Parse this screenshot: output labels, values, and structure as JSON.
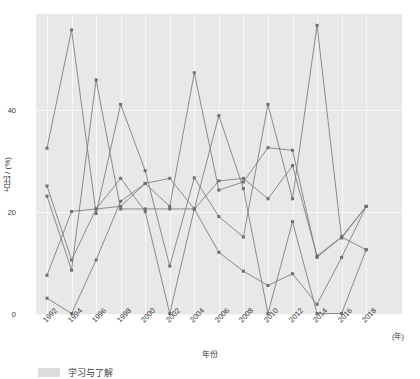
{
  "chart_data": {
    "type": "line",
    "title": "",
    "xlabel": "年份",
    "ylabel": "占比 / (%)",
    "x_unit": "(年)",
    "x": [
      1992,
      1994,
      1996,
      1998,
      2000,
      2002,
      2004,
      2006,
      2008,
      2010,
      2012,
      2014,
      2016,
      2018
    ],
    "categories": [
      "1992",
      "1994",
      "1996",
      "1998",
      "2000",
      "2002",
      "2004",
      "2006",
      "2008",
      "2010",
      "2012",
      "2014",
      "2016",
      "2018"
    ],
    "xtick_labels": [
      "1992",
      "1994",
      "1996",
      "1998",
      "2000",
      "2002",
      "2004",
      "2006",
      "2008",
      "2010",
      "2012",
      "2014",
      "2016",
      "2018"
    ],
    "ytick_labels": [
      "0",
      "20",
      "40"
    ],
    "yticks": [
      0,
      20,
      40
    ],
    "ylim": [
      -1.5,
      58.5
    ],
    "xlim": [
      1991,
      2019.5
    ],
    "grid": true,
    "grid_color": "#f7f7f7",
    "panel_background": "#e8e8e8",
    "legend_position": "bottom-left",
    "line_color": "#7f7f7f",
    "marker_color": "#6e6e6e",
    "series": [
      {
        "name": "s1",
        "values": [
          32.4,
          55.6,
          19.6,
          41.0,
          28.0,
          9.3,
          26.6,
          19.0,
          15.0,
          41.0,
          22.5,
          56.5,
          14.8,
          21.0
        ]
      },
      {
        "name": "s2",
        "values": [
          25.0,
          10.5,
          20.5,
          21.0,
          25.5,
          21.0,
          47.2,
          24.2,
          25.8,
          32.5,
          32.0,
          11.0,
          15.0,
          21.0
        ]
      },
      {
        "name": "s3",
        "values": [
          23.0,
          8.5,
          45.8,
          20.5,
          20.5,
          20.5,
          20.5,
          26.0,
          26.5,
          22.5,
          29.0,
          11.3,
          15.0,
          12.5
        ]
      },
      {
        "name": "s4",
        "values": [
          7.5,
          20.0,
          20.5,
          26.5,
          20.0,
          0.0,
          20.5,
          38.8,
          24.5,
          0.0,
          18.0,
          0.0,
          0.0,
          12.5
        ]
      },
      {
        "name": "s5",
        "values": [
          3.0,
          0.0,
          10.5,
          22.0,
          25.5,
          26.5,
          20.5,
          12.0,
          8.3,
          5.5,
          7.8,
          1.8,
          11.0,
          21.0
        ]
      }
    ]
  },
  "legend": {
    "items": [
      {
        "label": "学习与了解",
        "swatch_color": "#dcdcdc"
      }
    ]
  }
}
